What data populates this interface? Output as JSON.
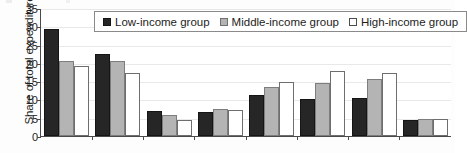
{
  "chart_data": {
    "type": "bar",
    "title": "",
    "xlabel": "",
    "ylabel": "Share of total expenditure",
    "ylim": [
      0,
      35
    ],
    "yticks": [
      0,
      5,
      10,
      15,
      20,
      25,
      30,
      35
    ],
    "grid": true,
    "legend_position": "top-center",
    "categories": [
      "1",
      "2",
      "3",
      "4",
      "5",
      "6",
      "7",
      "8"
    ],
    "category_labels_visible": false,
    "series": [
      {
        "name": "Low-income group",
        "color": "#262626",
        "values": [
          29.2,
          22.4,
          6.8,
          6.5,
          11.3,
          10.2,
          10.4,
          4.4
        ]
      },
      {
        "name": "Middle-income group",
        "color": "#b4b4b4",
        "values": [
          20.5,
          20.5,
          5.7,
          7.3,
          13.5,
          14.4,
          15.6,
          4.7
        ]
      },
      {
        "name": "High-income group",
        "color": "#ffffff",
        "values": [
          19.1,
          17.2,
          4.4,
          7.0,
          14.8,
          17.9,
          17.2,
          4.6
        ]
      }
    ]
  },
  "legend": {
    "items": [
      {
        "label": "Low-income group",
        "swatch": "filled-black-square-icon"
      },
      {
        "label": "Middle-income group",
        "swatch": "filled-gray-square-icon"
      },
      {
        "label": "High-income group",
        "swatch": "empty-white-square-icon"
      }
    ]
  }
}
